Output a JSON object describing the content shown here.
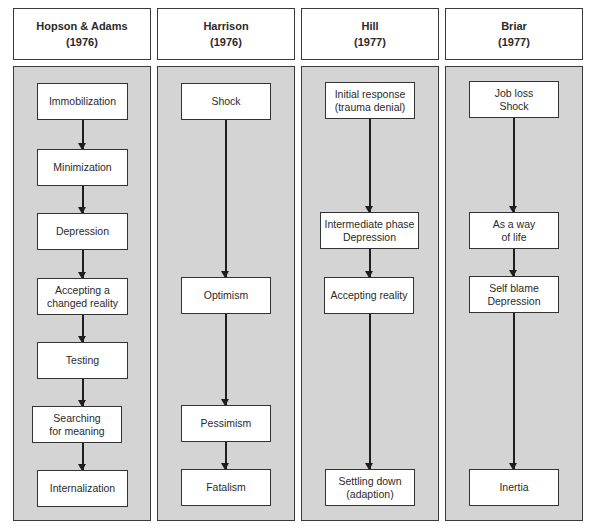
{
  "diagram": {
    "title": "",
    "columns": [
      {
        "author": "Hopson & Adams",
        "year": "(1976)",
        "stages": [
          "Immobilization",
          "Minimization",
          "Depression",
          "Accepting a\nchanged reality",
          "Testing",
          "Searching\nfor meaning",
          "Internalization"
        ]
      },
      {
        "author": "Harrison",
        "year": "(1976)",
        "stages": [
          "Shock",
          "Optimism",
          "Pessimism",
          "Fatalism"
        ]
      },
      {
        "author": "Hill",
        "year": "(1977)",
        "stages": [
          "Initial response\n(trauma denial)",
          "Intermediate phase\nDepression",
          "Accepting reality",
          "Settling down\n(adaption)"
        ]
      },
      {
        "author": "Briar",
        "year": "(1977)",
        "stages": [
          "Job loss\nShock",
          "As a way\nof life",
          "Self blame\nDepression",
          "Inertia"
        ]
      }
    ],
    "colors": {
      "panel_fill": "#d4d4d4",
      "box_fill": "#ffffff",
      "border": "#333333"
    }
  }
}
